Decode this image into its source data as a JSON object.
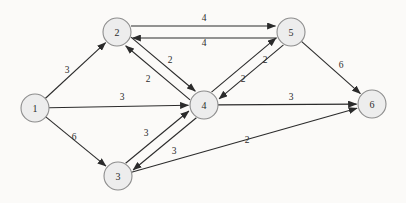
{
  "diagram": {
    "background_color": "#fbfaf8",
    "node_fill": "#ededed",
    "node_stroke": "#8d8d8d",
    "edge_color": "#2b2b2b",
    "width": 406,
    "height": 203,
    "node_radius": 14
  },
  "nodes": [
    {
      "id": "1",
      "label": "1",
      "x": 35,
      "y": 108
    },
    {
      "id": "2",
      "label": "2",
      "x": 117,
      "y": 32
    },
    {
      "id": "3",
      "label": "3",
      "x": 118,
      "y": 176
    },
    {
      "id": "4",
      "label": "4",
      "x": 204,
      "y": 105
    },
    {
      "id": "5",
      "label": "5",
      "x": 291,
      "y": 32
    },
    {
      "id": "6",
      "label": "6",
      "x": 372,
      "y": 104
    }
  ],
  "edges": [
    {
      "from": "1",
      "to": "2",
      "weight": "3",
      "label_x": 67,
      "label_y": 70,
      "curve": 0
    },
    {
      "from": "1",
      "to": "4",
      "weight": "3",
      "label_x": 122,
      "label_y": 97,
      "curve": 0
    },
    {
      "from": "1",
      "to": "3",
      "weight": "6",
      "label_x": 74,
      "label_y": 137,
      "curve": 0
    },
    {
      "from": "2",
      "to": "5",
      "weight": "4",
      "label_x": 204,
      "label_y": 18,
      "curve": -6
    },
    {
      "from": "5",
      "to": "2",
      "weight": "4",
      "label_x": 204,
      "label_y": 43,
      "curve": -6
    },
    {
      "from": "2",
      "to": "4",
      "weight": "2",
      "label_x": 148,
      "label_y": 79,
      "curve": -5
    },
    {
      "from": "4",
      "to": "2",
      "weight": "2",
      "label_x": 170,
      "label_y": 60,
      "curve": -5
    },
    {
      "from": "4",
      "to": "5",
      "weight": "2",
      "label_x": 243,
      "label_y": 79,
      "curve": -5
    },
    {
      "from": "5",
      "to": "4",
      "weight": "2",
      "label_x": 265,
      "label_y": 60,
      "curve": -5
    },
    {
      "from": "3",
      "to": "4",
      "weight": "3",
      "label_x": 146,
      "label_y": 133,
      "curve": -5
    },
    {
      "from": "4",
      "to": "3",
      "weight": "3",
      "label_x": 174,
      "label_y": 151,
      "curve": -5
    },
    {
      "from": "4",
      "to": "6",
      "weight": "3",
      "label_x": 291,
      "label_y": 97,
      "curve": 0
    },
    {
      "from": "5",
      "to": "6",
      "weight": "6",
      "label_x": 341,
      "label_y": 65,
      "curve": 0
    },
    {
      "from": "3",
      "to": "6",
      "weight": "2",
      "label_x": 247,
      "label_y": 140,
      "curve": 0
    }
  ]
}
